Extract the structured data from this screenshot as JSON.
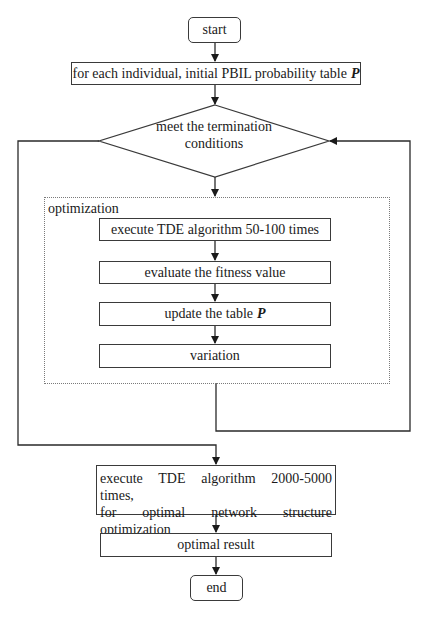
{
  "diagram": {
    "type": "flowchart",
    "nodes": {
      "start": {
        "label": "start",
        "shape": "rounded-rectangle"
      },
      "init": {
        "label": "for each individual, initial PBIL probability table",
        "symbol": "P",
        "shape": "rectangle"
      },
      "decision": {
        "label_line1": "meet the termination",
        "label_line2": "conditions",
        "shape": "diamond"
      },
      "optimization_group": {
        "label": "optimization",
        "shape": "dotted-rectangle"
      },
      "execute_small": {
        "label": "execute TDE algorithm 50-100 times",
        "shape": "rectangle"
      },
      "evaluate": {
        "label": "evaluate the fitness value",
        "shape": "rectangle"
      },
      "update": {
        "label": "update the table",
        "symbol": "P",
        "shape": "rectangle"
      },
      "variation": {
        "label": "variation",
        "shape": "rectangle"
      },
      "execute_large": {
        "label_line1": "execute TDE algorithm 2000-5000 times,",
        "label_line2": "for optimal network structure optimization",
        "shape": "rectangle"
      },
      "result": {
        "label": "optimal result",
        "shape": "rectangle"
      },
      "end": {
        "label": "end",
        "shape": "rounded-rectangle"
      }
    },
    "edges": [
      {
        "from": "start",
        "to": "init"
      },
      {
        "from": "init",
        "to": "decision"
      },
      {
        "from": "decision",
        "to": "optimization_group",
        "exit": "bottom"
      },
      {
        "from": "execute_small",
        "to": "evaluate"
      },
      {
        "from": "evaluate",
        "to": "update"
      },
      {
        "from": "update",
        "to": "variation"
      },
      {
        "from": "optimization_group",
        "to": "decision",
        "exit": "bottom",
        "entry": "right",
        "note": "loop back"
      },
      {
        "from": "decision",
        "to": "execute_large",
        "exit": "left"
      },
      {
        "from": "execute_large",
        "to": "result"
      },
      {
        "from": "result",
        "to": "end"
      }
    ],
    "colors": {
      "line": "#2a2a2a",
      "border": "#3a3a3a",
      "dotted_border": "#7a7a7a",
      "background": "#ffffff",
      "text": "#1a1a1a"
    }
  }
}
